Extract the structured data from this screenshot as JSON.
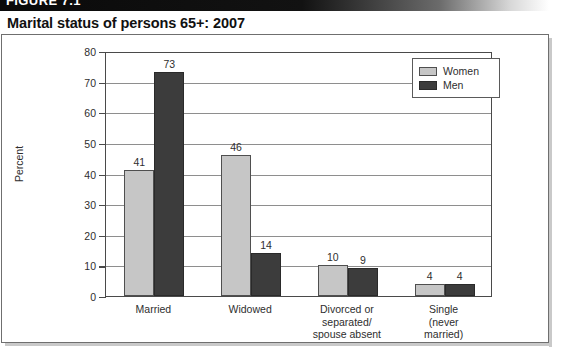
{
  "figure": {
    "banner_label": "FIGURE 7.1",
    "title": "Marital status of persons 65+: 2007"
  },
  "chart_data": {
    "type": "bar",
    "title": "Marital status of persons 65+: 2007",
    "xlabel": "",
    "ylabel": "Percent",
    "ylim": [
      0,
      80
    ],
    "yticks": [
      0,
      10,
      20,
      30,
      40,
      50,
      60,
      70,
      80
    ],
    "grid": true,
    "legend_position": "upper right",
    "categories": [
      "Married",
      "Widowed",
      "Divorced or\nseparated/\nspouse absent",
      "Single\n(never\nmarried)"
    ],
    "series": [
      {
        "name": "Women",
        "color": "#c6c6c6",
        "values": [
          41,
          46,
          10,
          4
        ]
      },
      {
        "name": "Men",
        "color": "#3c3c3c",
        "values": [
          73,
          14,
          9,
          4
        ]
      }
    ]
  }
}
